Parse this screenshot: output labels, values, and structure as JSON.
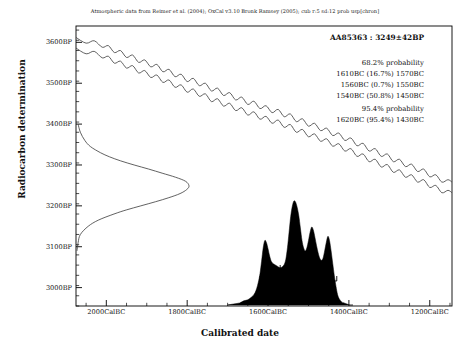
{
  "citation": "Atmospheric data from Reimer et al. (2004); OxCal v3.10 Bronk Ramsey (2005); cub r:5 sd:12 prob usp[chron]",
  "axes": {
    "ylabel": "Radiocarbon determination",
    "xlabel": "Calibrated date"
  },
  "annotation": {
    "sample_id": "AA85363 : 3249±42BP",
    "sigma1_header": "68.2% probability",
    "sigma1_ranges": [
      "1610BC (16.7%) 1570BC",
      "1560BC (0.7%) 1550BC",
      "1540BC (50.8%) 1450BC"
    ],
    "sigma2_header": "95.4% probability",
    "sigma2_ranges": [
      "1620BC (95.4%) 1430BC"
    ]
  },
  "chart_data": {
    "type": "line",
    "title": "Atmospheric data from Reimer et al. (2004); OxCal v3.10 Bronk Ramsey (2005); cub r:5 sd:12 prob usp[chron]",
    "xlabel": "Calibrated date",
    "ylabel": "Radiocarbon determination",
    "grid": false,
    "legend": "none",
    "xlim": [
      -2075,
      -1145
    ],
    "ylim": [
      2955,
      3640
    ],
    "x_ticks": [
      -2000,
      -1800,
      -1600,
      -1400,
      -1200
    ],
    "x_tick_labels": [
      "2000CalBC",
      "1800CalBC",
      "1600CalBC",
      "1400CalBC",
      "1200CalBC"
    ],
    "x_minor_tick_step": 50,
    "y_ticks": [
      3000,
      3100,
      3200,
      3300,
      3400,
      3500,
      3600
    ],
    "y_tick_labels": [
      "3000BP",
      "3100BP",
      "3200BP",
      "3300BP",
      "3400BP",
      "3500BP",
      "3600BP"
    ],
    "y_minor_tick_step": 25,
    "measurement": {
      "label": "AA85363",
      "radiocarbon_age_bp": 3249,
      "uncertainty_bp": 42
    },
    "series": [
      {
        "name": "calibration_curve_upper",
        "x": [
          -2075,
          -2050,
          -2030,
          -2010,
          -1995,
          -1980,
          -1965,
          -1950,
          -1935,
          -1920,
          -1905,
          -1890,
          -1875,
          -1860,
          -1845,
          -1830,
          -1815,
          -1800,
          -1785,
          -1770,
          -1755,
          -1740,
          -1725,
          -1710,
          -1695,
          -1680,
          -1665,
          -1650,
          -1635,
          -1620,
          -1605,
          -1590,
          -1575,
          -1560,
          -1545,
          -1530,
          -1515,
          -1500,
          -1485,
          -1470,
          -1455,
          -1440,
          -1425,
          -1410,
          -1395,
          -1380,
          -1365,
          -1350,
          -1335,
          -1320,
          -1305,
          -1290,
          -1275,
          -1260,
          -1245,
          -1230,
          -1215,
          -1200,
          -1185,
          -1170,
          -1155,
          -1145
        ],
        "y": [
          3612,
          3598,
          3604,
          3588,
          3592,
          3575,
          3580,
          3563,
          3569,
          3551,
          3557,
          3540,
          3546,
          3528,
          3534,
          3516,
          3522,
          3504,
          3512,
          3494,
          3500,
          3481,
          3488,
          3470,
          3477,
          3459,
          3466,
          3448,
          3456,
          3438,
          3445,
          3428,
          3436,
          3418,
          3425,
          3406,
          3413,
          3395,
          3402,
          3384,
          3390,
          3372,
          3378,
          3360,
          3366,
          3347,
          3353,
          3334,
          3340,
          3321,
          3327,
          3308,
          3314,
          3296,
          3302,
          3284,
          3290,
          3271,
          3276,
          3258,
          3264,
          3258
        ]
      },
      {
        "name": "calibration_curve_lower",
        "x": [
          -2075,
          -2050,
          -2030,
          -2010,
          -1995,
          -1980,
          -1965,
          -1950,
          -1935,
          -1920,
          -1905,
          -1890,
          -1875,
          -1860,
          -1845,
          -1830,
          -1815,
          -1800,
          -1785,
          -1770,
          -1755,
          -1740,
          -1725,
          -1710,
          -1695,
          -1680,
          -1665,
          -1650,
          -1635,
          -1620,
          -1605,
          -1590,
          -1575,
          -1560,
          -1545,
          -1530,
          -1515,
          -1500,
          -1485,
          -1470,
          -1455,
          -1440,
          -1425,
          -1410,
          -1395,
          -1380,
          -1365,
          -1350,
          -1335,
          -1320,
          -1305,
          -1290,
          -1275,
          -1260,
          -1245,
          -1230,
          -1215,
          -1200,
          -1185,
          -1170,
          -1155,
          -1145
        ],
        "y": [
          3586,
          3572,
          3578,
          3562,
          3566,
          3549,
          3554,
          3537,
          3543,
          3525,
          3531,
          3514,
          3520,
          3502,
          3508,
          3490,
          3496,
          3478,
          3486,
          3468,
          3474,
          3455,
          3462,
          3444,
          3451,
          3433,
          3440,
          3422,
          3430,
          3412,
          3419,
          3402,
          3410,
          3392,
          3399,
          3380,
          3387,
          3369,
          3376,
          3358,
          3364,
          3346,
          3352,
          3334,
          3340,
          3321,
          3327,
          3308,
          3314,
          3295,
          3301,
          3282,
          3288,
          3270,
          3276,
          3258,
          3264,
          3245,
          3250,
          3232,
          3238,
          3232
        ]
      },
      {
        "name": "radiocarbon_age_likelihood",
        "orientation": "horizontal",
        "peak_bp": 3249,
        "sigma_bp": 42,
        "x_bp": [
          3400,
          3380,
          3360,
          3345,
          3330,
          3320,
          3310,
          3300,
          3290,
          3280,
          3270,
          3260,
          3249,
          3240,
          3230,
          3220,
          3210,
          3200,
          3190,
          3180,
          3165,
          3150,
          3130,
          3110,
          3090
        ],
        "amplitude": [
          0.01,
          0.03,
          0.07,
          0.12,
          0.21,
          0.29,
          0.39,
          0.51,
          0.64,
          0.76,
          0.88,
          0.97,
          1.0,
          0.98,
          0.92,
          0.82,
          0.7,
          0.57,
          0.44,
          0.33,
          0.19,
          0.1,
          0.03,
          0.01,
          0.0
        ]
      },
      {
        "name": "calibrated_probability_distribution",
        "fill": "#000000",
        "x": [
          -1700,
          -1685,
          -1670,
          -1660,
          -1650,
          -1643,
          -1637,
          -1632,
          -1628,
          -1624,
          -1620,
          -1616,
          -1612,
          -1608,
          -1604,
          -1600,
          -1596,
          -1592,
          -1588,
          -1584,
          -1580,
          -1576,
          -1572,
          -1568,
          -1564,
          -1560,
          -1556,
          -1552,
          -1548,
          -1544,
          -1540,
          -1536,
          -1532,
          -1528,
          -1524,
          -1520,
          -1516,
          -1512,
          -1508,
          -1504,
          -1500,
          -1496,
          -1492,
          -1488,
          -1484,
          -1480,
          -1476,
          -1472,
          -1468,
          -1464,
          -1460,
          -1456,
          -1452,
          -1448,
          -1444,
          -1440,
          -1436,
          -1432,
          -1428,
          -1424,
          -1418,
          -1412,
          -1405,
          -1398,
          -1390
        ],
        "y": [
          0.0,
          0.01,
          0.02,
          0.04,
          0.05,
          0.07,
          0.09,
          0.12,
          0.16,
          0.22,
          0.3,
          0.42,
          0.55,
          0.62,
          0.6,
          0.54,
          0.47,
          0.42,
          0.4,
          0.39,
          0.38,
          0.37,
          0.36,
          0.36,
          0.37,
          0.39,
          0.44,
          0.55,
          0.7,
          0.85,
          0.95,
          1.0,
          0.99,
          0.94,
          0.86,
          0.74,
          0.62,
          0.55,
          0.52,
          0.55,
          0.62,
          0.7,
          0.75,
          0.72,
          0.65,
          0.57,
          0.5,
          0.45,
          0.43,
          0.45,
          0.52,
          0.6,
          0.66,
          0.62,
          0.52,
          0.4,
          0.28,
          0.18,
          0.1,
          0.06,
          0.03,
          0.02,
          0.01,
          0.0,
          0.0
        ]
      }
    ],
    "range_bars": {
      "sigma1": [
        {
          "from": -1610,
          "to": -1570
        },
        {
          "from": -1560,
          "to": -1550
        },
        {
          "from": -1540,
          "to": -1450
        }
      ],
      "sigma2": [
        {
          "from": -1620,
          "to": -1430
        }
      ]
    }
  }
}
